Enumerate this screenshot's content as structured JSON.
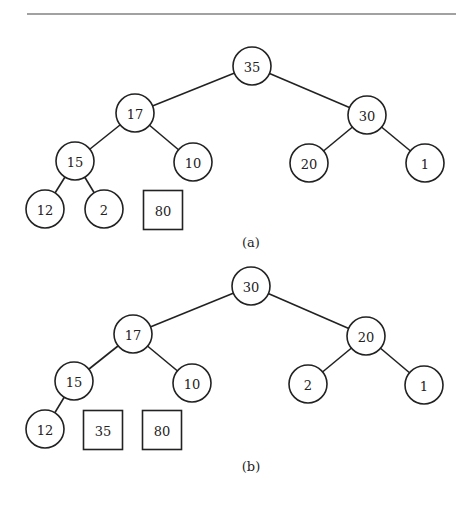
{
  "figure": {
    "top_rule": {
      "x1": 27,
      "x2": 456,
      "y": 14
    },
    "radius": 19,
    "panels": [
      {
        "caption": "(a)",
        "caption_pos": {
          "x": 251,
          "y": 242
        },
        "nodes": [
          {
            "id": "a35",
            "label": "35",
            "shape": "circle",
            "x": 252,
            "y": 66
          },
          {
            "id": "a17",
            "label": "17",
            "shape": "circle",
            "x": 135,
            "y": 113
          },
          {
            "id": "a30",
            "label": "30",
            "shape": "circle",
            "x": 367,
            "y": 115
          },
          {
            "id": "a15",
            "label": "15",
            "shape": "circle",
            "x": 75,
            "y": 161
          },
          {
            "id": "a10",
            "label": "10",
            "shape": "circle",
            "x": 193,
            "y": 162
          },
          {
            "id": "a20",
            "label": "20",
            "shape": "circle",
            "x": 309,
            "y": 163
          },
          {
            "id": "a1",
            "label": "1",
            "shape": "circle",
            "x": 425,
            "y": 163
          },
          {
            "id": "a12",
            "label": "12",
            "shape": "circle",
            "x": 45,
            "y": 209
          },
          {
            "id": "a2",
            "label": "2",
            "shape": "circle",
            "x": 104,
            "y": 209
          },
          {
            "id": "a80",
            "label": "80",
            "shape": "square",
            "x": 163,
            "y": 210
          }
        ],
        "edges": [
          [
            "a35",
            "a17"
          ],
          [
            "a35",
            "a30"
          ],
          [
            "a17",
            "a15"
          ],
          [
            "a17",
            "a10"
          ],
          [
            "a30",
            "a20"
          ],
          [
            "a30",
            "a1"
          ],
          [
            "a15",
            "a12"
          ],
          [
            "a15",
            "a2"
          ]
        ]
      },
      {
        "caption": "(b)",
        "caption_pos": {
          "x": 251,
          "y": 466
        },
        "nodes": [
          {
            "id": "b30",
            "label": "30",
            "shape": "circle",
            "x": 251,
            "y": 286
          },
          {
            "id": "b17",
            "label": "17",
            "shape": "circle",
            "x": 133,
            "y": 334
          },
          {
            "id": "b20",
            "label": "20",
            "shape": "circle",
            "x": 366,
            "y": 336
          },
          {
            "id": "b15",
            "label": "15",
            "shape": "circle",
            "x": 74,
            "y": 381
          },
          {
            "id": "b10",
            "label": "10",
            "shape": "circle",
            "x": 192,
            "y": 383
          },
          {
            "id": "b2",
            "label": "2",
            "shape": "circle",
            "x": 308,
            "y": 384
          },
          {
            "id": "b1",
            "label": "1",
            "shape": "circle",
            "x": 424,
            "y": 385
          },
          {
            "id": "b12",
            "label": "12",
            "shape": "circle",
            "x": 45,
            "y": 429
          },
          {
            "id": "b35",
            "label": "35",
            "shape": "square",
            "x": 103,
            "y": 430
          },
          {
            "id": "b80",
            "label": "80",
            "shape": "square",
            "x": 162,
            "y": 430
          }
        ],
        "edges": [
          [
            "b30",
            "b17"
          ],
          [
            "b30",
            "b20"
          ],
          [
            "b17",
            "b15"
          ],
          [
            "b17",
            "b10"
          ],
          [
            "b20",
            "b2"
          ],
          [
            "b20",
            "b1"
          ],
          [
            "b15",
            "b12"
          ]
        ]
      }
    ]
  }
}
